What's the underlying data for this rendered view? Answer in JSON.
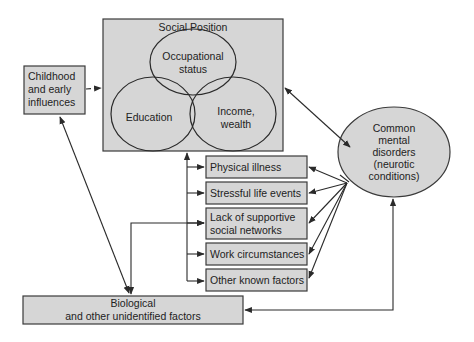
{
  "diagram": {
    "social_position": {
      "title": "Social Position",
      "circles": {
        "occupational": [
          "Occupational",
          "status"
        ],
        "education": "Education",
        "income": [
          "Income,",
          "wealth"
        ]
      }
    },
    "childhood": [
      "Childhood",
      "and early",
      "influences"
    ],
    "outcome": [
      "Common",
      "mental",
      "disorders",
      "(neurotic",
      "conditions)"
    ],
    "factors": [
      {
        "lines": [
          "Physical illness"
        ]
      },
      {
        "lines": [
          "Stressful life events"
        ]
      },
      {
        "lines": [
          "Lack of supportive",
          "social networks"
        ]
      },
      {
        "lines": [
          "Work circumstances"
        ]
      },
      {
        "lines": [
          "Other known factors"
        ]
      }
    ],
    "biological": [
      "Biological",
      "and other unidentified factors"
    ],
    "colors": {
      "box_fill": "#d6d6d6",
      "stroke": "#2a2a2a",
      "background": "#ffffff"
    }
  }
}
